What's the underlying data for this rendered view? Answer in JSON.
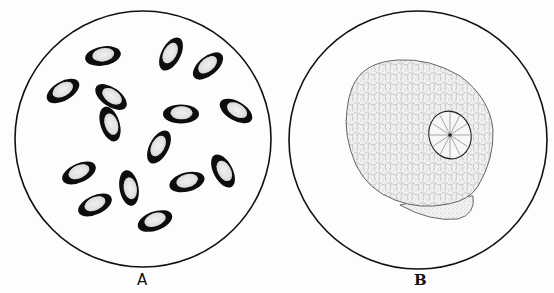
{
  "figure": {
    "panels": [
      {
        "id": "A",
        "label": "A",
        "description": "Field of view with scattered oval spores, each with a thick dark rim and stippled light center",
        "circle": {
          "cx": 143,
          "cy": 139,
          "r": 128
        },
        "spores": [
          {
            "cx": 103,
            "cy": 56,
            "rot": -10
          },
          {
            "cx": 171,
            "cy": 54,
            "rot": -62
          },
          {
            "cx": 208,
            "cy": 66,
            "rot": -40
          },
          {
            "cx": 63,
            "cy": 91,
            "rot": -30
          },
          {
            "cx": 111,
            "cy": 97,
            "rot": 35
          },
          {
            "cx": 110,
            "cy": 124,
            "rot": 72
          },
          {
            "cx": 181,
            "cy": 114,
            "rot": 0
          },
          {
            "cx": 236,
            "cy": 111,
            "rot": 30
          },
          {
            "cx": 159,
            "cy": 147,
            "rot": -62
          },
          {
            "cx": 79,
            "cy": 173,
            "rot": -25
          },
          {
            "cx": 129,
            "cy": 188,
            "rot": 80
          },
          {
            "cx": 187,
            "cy": 182,
            "rot": -15
          },
          {
            "cx": 223,
            "cy": 171,
            "rot": 62
          },
          {
            "cx": 95,
            "cy": 205,
            "rot": -25
          },
          {
            "cx": 155,
            "cy": 221,
            "rot": -20
          }
        ]
      },
      {
        "id": "B",
        "label": "B",
        "description": "Field of view with single large reticulate cell containing a round nucleus with radial lines",
        "circle": {
          "cx": 418,
          "cy": 140,
          "r": 129
        },
        "nucleus": {
          "cx": 450,
          "cy": 135,
          "rx": 21,
          "ry": 24
        }
      }
    ],
    "colors": {
      "background": "#fdfdfd",
      "ink": "#111111",
      "stipple": "#9a9a9a"
    }
  }
}
